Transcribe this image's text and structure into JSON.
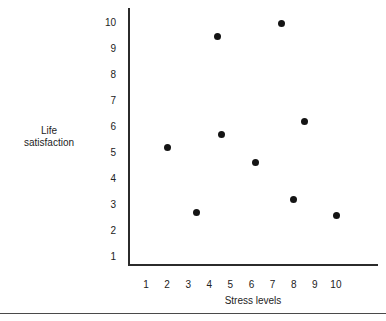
{
  "chart_data": {
    "type": "scatter",
    "title": "",
    "xlabel": "Stress levels",
    "ylabel": "Life satisfaction",
    "ylabel_lines": [
      "Life",
      "satisfaction"
    ],
    "xlim": [
      0.5,
      10.6
    ],
    "ylim": [
      0.7,
      10.4
    ],
    "xticks": [
      "1",
      "2",
      "3",
      "4",
      "5",
      "6",
      "7",
      "8",
      "9",
      "10"
    ],
    "yticks": [
      "10",
      "9",
      "8",
      "7",
      "6",
      "5",
      "4",
      "3",
      "2",
      "1"
    ],
    "grid": false,
    "legend": null,
    "marker": "filled-circle",
    "marker_color": "#141414",
    "axis_color": "#2b2b2b",
    "background": "#ffffff",
    "points": [
      {
        "x": 2.0,
        "y": 5.2
      },
      {
        "x": 3.4,
        "y": 2.7
      },
      {
        "x": 4.4,
        "y": 9.5
      },
      {
        "x": 4.6,
        "y": 5.7
      },
      {
        "x": 6.2,
        "y": 4.65
      },
      {
        "x": 7.4,
        "y": 10.0
      },
      {
        "x": 8.0,
        "y": 3.2
      },
      {
        "x": 8.5,
        "y": 6.2
      },
      {
        "x": 10.05,
        "y": 2.6
      }
    ]
  }
}
